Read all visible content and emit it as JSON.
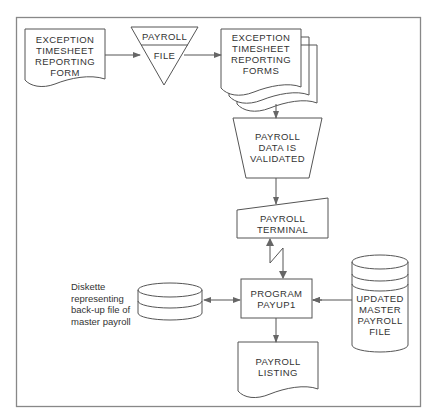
{
  "diagram": {
    "type": "flowchart",
    "nodes": {
      "exception_form": {
        "shape": "document",
        "label": "EXCEPTION\nTIMESHEET\nREPORTING\nFORM"
      },
      "payroll_file": {
        "shape": "offline-storage",
        "label_top": "PAYROLL",
        "label_bottom": "FILE"
      },
      "exception_forms": {
        "shape": "multi-document",
        "label": "EXCEPTION\nTIMESHEET\nREPORTING\nFORMS"
      },
      "validated": {
        "shape": "manual-operation",
        "label": "PAYROLL\nDATA IS\nVALIDATED"
      },
      "terminal": {
        "shape": "manual-input",
        "label": "PAYROLL\nTERMINAL"
      },
      "program": {
        "shape": "process",
        "label": "PROGRAM\nPAYUP1"
      },
      "diskette": {
        "shape": "disk",
        "label": ""
      },
      "diskette_note": {
        "text": "Diskette\nrepresenting\nback-up file of\nmaster payroll"
      },
      "master": {
        "shape": "magnetic-disk",
        "label": "UPDATED\nMASTER\nPAYROLL\nFILE"
      },
      "listing": {
        "shape": "document",
        "label": "PAYROLL\nLISTING"
      }
    },
    "edges": [
      {
        "from": "exception_form",
        "to": "payroll_file"
      },
      {
        "from": "payroll_file",
        "to": "exception_forms"
      },
      {
        "from": "exception_forms",
        "to": "validated"
      },
      {
        "from": "validated",
        "to": "terminal"
      },
      {
        "from": "terminal",
        "to": "program",
        "style": "communication-link",
        "bidirectional": true
      },
      {
        "from": "diskette",
        "to": "program",
        "bidirectional": true
      },
      {
        "from": "master",
        "to": "program",
        "direction": "into program"
      },
      {
        "from": "program",
        "to": "listing"
      }
    ],
    "colors": {
      "line": "#555555",
      "text": "#333333",
      "border": "#888888"
    }
  }
}
